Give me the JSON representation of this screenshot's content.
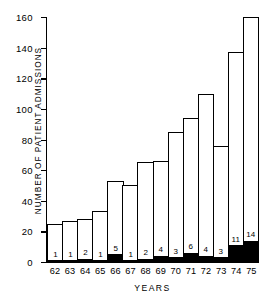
{
  "chart_data": {
    "type": "bar",
    "title": "",
    "xlabel": "YEARS",
    "ylabel": "NUMBER OF PATIENT ADMISSIONS",
    "categories": [
      "62",
      "63",
      "64",
      "65",
      "66",
      "67",
      "68",
      "69",
      "70",
      "71",
      "72",
      "73",
      "74",
      "75"
    ],
    "ylim": [
      0,
      160
    ],
    "ytick_step": 20,
    "yticks": [
      "160",
      "140",
      "120",
      "100",
      "80",
      "60",
      "40",
      "20",
      "0"
    ],
    "ytick_values": [
      160,
      140,
      120,
      100,
      80,
      60,
      40,
      20,
      0
    ],
    "grid": false,
    "legend": false,
    "series": [
      {
        "name": "Total patient admissions",
        "values": [
          25,
          27,
          28,
          33,
          53,
          50,
          65,
          66,
          85,
          94,
          110,
          76,
          137,
          160
        ]
      },
      {
        "name": "Filled (black) subset",
        "values": [
          1,
          1,
          2,
          1,
          5,
          1,
          2,
          4,
          3,
          6,
          4,
          3,
          11,
          14
        ]
      }
    ],
    "bar_labels": [
      "1",
      "1",
      "2",
      "1",
      "5",
      "1",
      "2",
      "4",
      "3",
      "6",
      "4",
      "3",
      "11",
      "14"
    ],
    "colors": {
      "bar_outline": "#000000",
      "bar_background": "#ffffff",
      "bar_fill": "#000000",
      "axis": "#000000",
      "page_background": "#ffffff"
    }
  }
}
